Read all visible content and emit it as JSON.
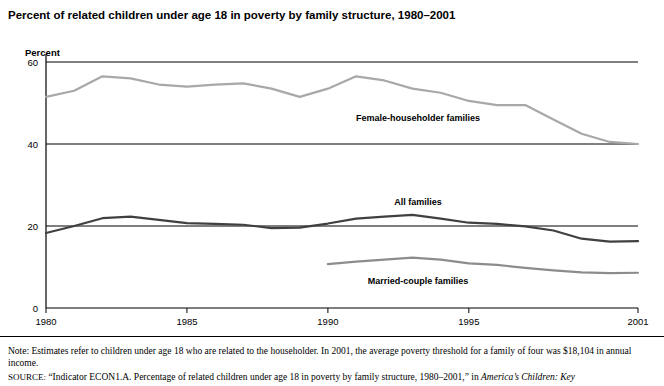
{
  "title": "Percent of related children under age 18 in poverty by family structure, 1980–2001",
  "axis": {
    "y_label": "Percent",
    "y_ticks": [
      "0",
      "20",
      "40",
      "60"
    ],
    "y_values": [
      0,
      20,
      40,
      60
    ],
    "x_ticks": [
      "1980",
      "1985",
      "1990",
      "1995",
      "2001"
    ],
    "x_tick_values": [
      1980,
      1985,
      1990,
      1995,
      2001
    ]
  },
  "notes": {
    "note": "Note: Estimates refer to children under age 18 who are related to the householder. In 2001, the average poverty threshold for a family of four was $18,104 in annual income.",
    "source_prefix": "SOURCE:",
    "source_text": "“Indicator ECON1.A. Percentage of related children under age 18 in poverty by family structure, 1980–2001,” in ",
    "source_italic": "America’s Children: Key"
  },
  "colors": {
    "female_householder": "#a8a8a8",
    "all_families": "#404040",
    "married_couple": "#8c8c8c",
    "axis": "#000000",
    "gridline": "#000000"
  },
  "chart_data": {
    "type": "line",
    "title": "Percent of related children under age 18 in poverty by family structure, 1980–2001",
    "xlabel": "",
    "ylabel": "Percent",
    "xlim": [
      1980,
      2001
    ],
    "ylim": [
      0,
      60
    ],
    "grid": true,
    "legend": "inline-labels",
    "x": [
      1980,
      1981,
      1982,
      1983,
      1984,
      1985,
      1986,
      1987,
      1988,
      1989,
      1990,
      1991,
      1992,
      1993,
      1994,
      1995,
      1996,
      1997,
      1998,
      1999,
      2000,
      2001
    ],
    "series": [
      {
        "name": "Female-householder families",
        "color": "#a8a8a8",
        "label_position": {
          "x": 1993.2,
          "y": 45.5
        },
        "values": [
          51.5,
          53.0,
          56.5,
          56.0,
          54.5,
          54.0,
          54.5,
          54.8,
          53.5,
          51.5,
          53.5,
          56.5,
          55.5,
          53.5,
          52.5,
          50.5,
          49.5,
          49.5,
          46.0,
          42.5,
          40.5,
          40.0
        ]
      },
      {
        "name": "All families",
        "color": "#404040",
        "label_position": {
          "x": 1993.2,
          "y": 25.2
        },
        "values": [
          18.3,
          20.0,
          21.9,
          22.3,
          21.5,
          20.7,
          20.5,
          20.3,
          19.5,
          19.6,
          20.6,
          21.8,
          22.3,
          22.7,
          21.8,
          20.8,
          20.5,
          19.9,
          18.9,
          16.9,
          16.2,
          16.3
        ]
      },
      {
        "name": "Married-couple families",
        "color": "#8c8c8c",
        "label_position": {
          "x": 1993.2,
          "y": 5.8
        },
        "values": [
          null,
          null,
          null,
          null,
          null,
          null,
          null,
          null,
          null,
          null,
          10.7,
          11.3,
          11.8,
          12.3,
          11.8,
          10.9,
          10.5,
          9.8,
          9.2,
          8.7,
          8.5,
          8.6
        ]
      }
    ]
  }
}
